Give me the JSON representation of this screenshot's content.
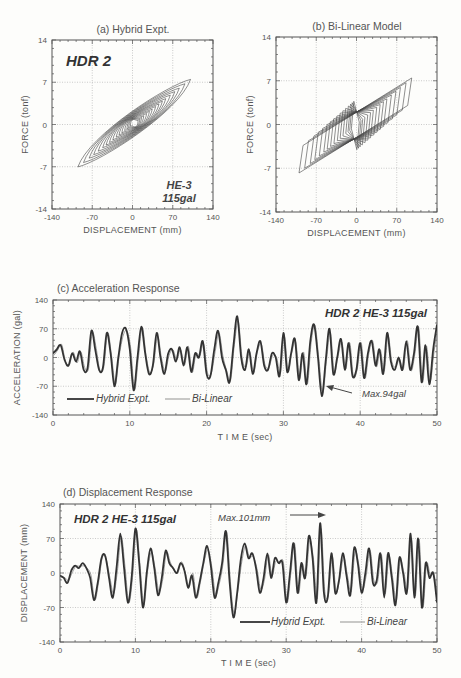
{
  "chart_data": [
    {
      "id": "a",
      "type": "line",
      "title": "(a) Hybrid Expt.",
      "xlabel": "DISPLACEMENT  (mm)",
      "ylabel": "FORCE  (tonf)",
      "xlim": [
        -140,
        140
      ],
      "ylim": [
        -14,
        14
      ],
      "xticks": [
        "-140",
        "-70",
        "0",
        "70",
        "140"
      ],
      "yticks": [
        "14",
        "7",
        "0",
        "-7",
        "-14"
      ],
      "grid": true,
      "annotations": [
        "HDR 2",
        "HE-3",
        "115gal"
      ],
      "description": "Hysteresis loops of high-damping rubber bearing (experiment), smooth spindle-shaped loops",
      "envelope": {
        "min_disp": -95,
        "min_force": -7.0,
        "max_disp": 101,
        "max_force": 7.5
      }
    },
    {
      "id": "b",
      "type": "line",
      "title": "(b) Bi-Linear Model",
      "xlabel": "DISPLACEMENT  (mm)",
      "ylabel": "FORCE  (tonf)",
      "xlim": [
        -140,
        140
      ],
      "ylim": [
        -14,
        14
      ],
      "xticks": [
        "-140",
        "-70",
        "0",
        "70",
        "140"
      ],
      "yticks": [
        "14",
        "7",
        "0",
        "-7",
        "-14"
      ],
      "grid": true,
      "description": "Parallelogram-shaped bi-linear hysteresis loops",
      "envelope": {
        "min_disp": -100,
        "min_force": -8.0,
        "max_disp": 96,
        "max_force": 7.2
      }
    },
    {
      "id": "c",
      "type": "line",
      "title": "(c) Acceleration Response",
      "xlabel": "T I M E  (sec)",
      "ylabel": "ACCELERATION  (gal)",
      "xlim": [
        0,
        50
      ],
      "ylim": [
        -140,
        140
      ],
      "xticks": [
        "0",
        "10",
        "20",
        "30",
        "40",
        "50"
      ],
      "yticks": [
        "140",
        "70",
        "0",
        "-70",
        "-140"
      ],
      "grid": true,
      "annotations": [
        "HDR 2  HE-3  115gal",
        "Max.94gal"
      ],
      "legend": [
        "Hybrid Expt.",
        "Bi-Linear"
      ],
      "legend_position": "lower-left",
      "series": [
        {
          "name": "Hybrid Expt.",
          "x": [
            0,
            0.5,
            1,
            1.5,
            2,
            2.5,
            3,
            3.5,
            4,
            4.5,
            5,
            5.5,
            6,
            6.5,
            7,
            7.5,
            8,
            8.5,
            9,
            9.5,
            10,
            10.5,
            11,
            11.5,
            12,
            12.5,
            13,
            13.5,
            14,
            14.5,
            15,
            15.5,
            16,
            16.5,
            17,
            17.5,
            18,
            18.5,
            19,
            19.5,
            20,
            20.5,
            21,
            21.5,
            22,
            22.5,
            23,
            23.5,
            24,
            24.5,
            25,
            25.5,
            26,
            26.5,
            27,
            27.5,
            28,
            28.5,
            29,
            29.5,
            30,
            30.5,
            31,
            31.5,
            32,
            32.5,
            33,
            33.5,
            34,
            34.5,
            35,
            35.5,
            36,
            36.5,
            37,
            37.5,
            38,
            38.5,
            39,
            39.5,
            40,
            40.5,
            41,
            41.5,
            42,
            42.5,
            43,
            43.5,
            44,
            44.5,
            45,
            45.5,
            46,
            46.5,
            47,
            47.5,
            48,
            48.5,
            49,
            49.5,
            50
          ],
          "values": [
            10,
            20,
            30,
            -5,
            -20,
            10,
            -10,
            15,
            -30,
            -25,
            65,
            20,
            -30,
            -25,
            60,
            10,
            -70,
            0,
            60,
            70,
            20,
            -80,
            0,
            75,
            10,
            -40,
            -20,
            60,
            0,
            -40,
            10,
            20,
            -10,
            25,
            -20,
            25,
            -35,
            10,
            0,
            40,
            -40,
            -45,
            20,
            65,
            0,
            -30,
            -60,
            30,
            100,
            0,
            -30,
            20,
            -40,
            10,
            40,
            -20,
            -30,
            10,
            0,
            -45,
            60,
            -35,
            10,
            45,
            -55,
            10,
            -65,
            40,
            80,
            0,
            -94,
            -10,
            70,
            -40,
            0,
            45,
            -30,
            35,
            -45,
            -30,
            35,
            -50,
            10,
            40,
            -20,
            20,
            -40,
            60,
            -10,
            -30,
            0,
            -30,
            40,
            -30,
            10,
            75,
            -60,
            30,
            -65,
            20,
            80
          ]
        },
        {
          "name": "Bi-Linear",
          "x": [
            0,
            5,
            10,
            15,
            20,
            25,
            30,
            35,
            40,
            45,
            50
          ],
          "values": [
            12,
            60,
            15,
            -10,
            35,
            95,
            55,
            -90,
            45,
            35,
            85
          ]
        }
      ]
    },
    {
      "id": "d",
      "type": "line",
      "title": "(d) Displacement Response",
      "xlabel": "T I M E  (sec)",
      "ylabel": "DISPLACEMENT  (mm)",
      "xlim": [
        0,
        50
      ],
      "ylim": [
        -140,
        140
      ],
      "xticks": [
        "0",
        "10",
        "20",
        "30",
        "40",
        "50"
      ],
      "yticks": [
        "140",
        "70",
        "0",
        "-70",
        "-140"
      ],
      "grid": true,
      "annotations": [
        "HDR 2  HE-3  115gal",
        "Max.101mm"
      ],
      "legend": [
        "Hybrid Expt.",
        "Bi-Linear"
      ],
      "legend_position": "lower-right",
      "series": [
        {
          "name": "Hybrid Expt.",
          "x": [
            0,
            0.5,
            1,
            1.5,
            2,
            2.5,
            3,
            3.5,
            4,
            4.5,
            5,
            5.5,
            6,
            6.5,
            7,
            7.5,
            8,
            8.5,
            9,
            9.5,
            10,
            10.5,
            11,
            11.5,
            12,
            12.5,
            13,
            13.5,
            14,
            14.5,
            15,
            15.5,
            16,
            16.5,
            17,
            17.5,
            18,
            18.5,
            19,
            19.5,
            20,
            20.5,
            21,
            21.5,
            22,
            22.5,
            23,
            23.5,
            24,
            24.5,
            25,
            25.5,
            26,
            26.5,
            27,
            27.5,
            28,
            28.5,
            29,
            29.5,
            30,
            30.5,
            31,
            31.5,
            32,
            32.5,
            33,
            33.5,
            34,
            34.5,
            35,
            35.5,
            36,
            36.5,
            37,
            37.5,
            38,
            38.5,
            39,
            39.5,
            40,
            40.5,
            41,
            41.5,
            42,
            42.5,
            43,
            43.5,
            44,
            44.5,
            45,
            45.5,
            46,
            46.5,
            47,
            47.5,
            48,
            48.5,
            49,
            49.5,
            50
          ],
          "values": [
            -5,
            -10,
            -20,
            5,
            15,
            10,
            20,
            10,
            -10,
            -55,
            -20,
            30,
            35,
            -10,
            -50,
            10,
            80,
            10,
            -60,
            -10,
            90,
            20,
            -70,
            0,
            50,
            10,
            -45,
            -10,
            45,
            20,
            10,
            0,
            20,
            5,
            -30,
            -5,
            -50,
            -20,
            20,
            55,
            15,
            -50,
            -20,
            20,
            85,
            -20,
            -90,
            -40,
            30,
            60,
            30,
            40,
            10,
            -40,
            -10,
            40,
            -10,
            30,
            20,
            20,
            -60,
            0,
            60,
            -40,
            20,
            -10,
            75,
            30,
            -60,
            101,
            -40,
            -50,
            40,
            -40,
            -15,
            40,
            -5,
            -45,
            50,
            20,
            -40,
            0,
            50,
            -20,
            -15,
            40,
            -50,
            40,
            -10,
            -65,
            30,
            0,
            -40,
            80,
            -50,
            70,
            -70,
            20,
            -10,
            0,
            -60
          ]
        },
        {
          "name": "Bi-Linear",
          "x": [
            0,
            10,
            20,
            25,
            30,
            35,
            40,
            45,
            50
          ],
          "values": [
            -3,
            75,
            -80,
            55,
            -55,
            92,
            -40,
            65,
            -55
          ]
        }
      ]
    }
  ]
}
